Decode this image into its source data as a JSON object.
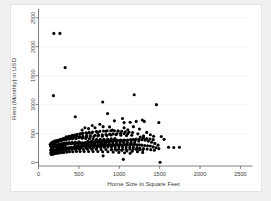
{
  "chart_data": {
    "type": "scatter",
    "title": "",
    "xlabel": "Home Size in Square Feet",
    "ylabel": "Rent (Monthly) in USD",
    "xlim": [
      0,
      2600
    ],
    "ylim": [
      -60,
      2600
    ],
    "xticks": [
      0,
      500,
      1000,
      1500,
      2000,
      2500
    ],
    "yticks": [
      0,
      500,
      1000,
      1500,
      2000,
      2500
    ],
    "xticklabels": [
      "0",
      "500",
      "1000",
      "1500",
      "2000",
      "2500"
    ],
    "yticklabels": [
      "0",
      "500",
      "1000",
      "1500",
      "2000",
      "2500"
    ],
    "grid": "horizontal",
    "legend": "none",
    "marker": "filled-circle",
    "marker_color": "#000000",
    "marker_size": 2.0,
    "points": [
      [
        190,
        2230
      ],
      [
        265,
        2230
      ],
      [
        330,
        1640
      ],
      [
        185,
        1155
      ],
      [
        795,
        1045
      ],
      [
        1185,
        1170
      ],
      [
        1460,
        1000
      ],
      [
        455,
        790
      ],
      [
        855,
        845
      ],
      [
        1490,
        690
      ],
      [
        1210,
        710
      ],
      [
        1285,
        735
      ],
      [
        1310,
        710
      ],
      [
        1060,
        690
      ],
      [
        1135,
        695
      ],
      [
        940,
        720
      ],
      [
        1040,
        760
      ],
      [
        665,
        640
      ],
      [
        700,
        600
      ],
      [
        760,
        660
      ],
      [
        800,
        620
      ],
      [
        880,
        615
      ],
      [
        620,
        585
      ],
      [
        575,
        600
      ],
      [
        540,
        560
      ],
      [
        1060,
        600
      ],
      [
        1105,
        565
      ],
      [
        1175,
        620
      ],
      [
        1250,
        580
      ],
      [
        985,
        545
      ],
      [
        915,
        560
      ],
      [
        835,
        540
      ],
      [
        730,
        520
      ],
      [
        660,
        510
      ],
      [
        600,
        505
      ],
      [
        525,
        495
      ],
      [
        470,
        480
      ],
      [
        420,
        470
      ],
      [
        380,
        455
      ],
      [
        345,
        445
      ],
      [
        1340,
        520
      ],
      [
        1385,
        480
      ],
      [
        1425,
        455
      ],
      [
        1300,
        460
      ],
      [
        1230,
        495
      ],
      [
        1155,
        470
      ],
      [
        1090,
        465
      ],
      [
        1020,
        470
      ],
      [
        960,
        480
      ],
      [
        900,
        475
      ],
      [
        845,
        465
      ],
      [
        790,
        455
      ],
      [
        735,
        460
      ],
      [
        685,
        450
      ],
      [
        640,
        445
      ],
      [
        595,
        440
      ],
      [
        550,
        435
      ],
      [
        505,
        430
      ],
      [
        465,
        425
      ],
      [
        430,
        420
      ],
      [
        395,
        415
      ],
      [
        360,
        410
      ],
      [
        325,
        405
      ],
      [
        295,
        400
      ],
      [
        265,
        395
      ],
      [
        235,
        385
      ],
      [
        205,
        375
      ],
      [
        180,
        360
      ],
      [
        160,
        340
      ],
      [
        145,
        315
      ],
      [
        1520,
        450
      ],
      [
        1555,
        400
      ],
      [
        1610,
        265
      ],
      [
        1675,
        260
      ],
      [
        1745,
        265
      ],
      [
        1480,
        300
      ],
      [
        1440,
        330
      ],
      [
        1400,
        350
      ],
      [
        1360,
        370
      ],
      [
        1320,
        385
      ],
      [
        1280,
        395
      ],
      [
        1245,
        400
      ],
      [
        1210,
        405
      ],
      [
        1175,
        400
      ],
      [
        1140,
        395
      ],
      [
        1105,
        390
      ],
      [
        1070,
        385
      ],
      [
        1035,
        380
      ],
      [
        1000,
        380
      ],
      [
        970,
        375
      ],
      [
        940,
        375
      ],
      [
        910,
        370
      ],
      [
        880,
        370
      ],
      [
        850,
        365
      ],
      [
        820,
        365
      ],
      [
        790,
        360
      ],
      [
        760,
        360
      ],
      [
        730,
        355
      ],
      [
        700,
        355
      ],
      [
        670,
        350
      ],
      [
        640,
        350
      ],
      [
        610,
        345
      ],
      [
        580,
        345
      ],
      [
        550,
        340
      ],
      [
        520,
        340
      ],
      [
        490,
        335
      ],
      [
        460,
        335
      ],
      [
        430,
        330
      ],
      [
        400,
        325
      ],
      [
        370,
        320
      ],
      [
        340,
        315
      ],
      [
        310,
        310
      ],
      [
        285,
        305
      ],
      [
        260,
        295
      ],
      [
        235,
        285
      ],
      [
        215,
        275
      ],
      [
        195,
        265
      ],
      [
        175,
        250
      ],
      [
        160,
        235
      ],
      [
        150,
        215
      ],
      [
        1490,
        240
      ],
      [
        1455,
        255
      ],
      [
        1420,
        270
      ],
      [
        1385,
        285
      ],
      [
        1350,
        290
      ],
      [
        1315,
        295
      ],
      [
        1280,
        300
      ],
      [
        1250,
        305
      ],
      [
        1220,
        305
      ],
      [
        1190,
        310
      ],
      [
        1160,
        310
      ],
      [
        1130,
        310
      ],
      [
        1100,
        310
      ],
      [
        1070,
        310
      ],
      [
        1040,
        305
      ],
      [
        1010,
        305
      ],
      [
        985,
        305
      ],
      [
        960,
        305
      ],
      [
        935,
        300
      ],
      [
        910,
        300
      ],
      [
        885,
        300
      ],
      [
        860,
        300
      ],
      [
        835,
        295
      ],
      [
        810,
        295
      ],
      [
        785,
        295
      ],
      [
        760,
        290
      ],
      [
        735,
        290
      ],
      [
        710,
        290
      ],
      [
        685,
        285
      ],
      [
        660,
        285
      ],
      [
        635,
        285
      ],
      [
        610,
        280
      ],
      [
        585,
        280
      ],
      [
        560,
        280
      ],
      [
        535,
        275
      ],
      [
        510,
        275
      ],
      [
        485,
        270
      ],
      [
        460,
        270
      ],
      [
        435,
        265
      ],
      [
        410,
        265
      ],
      [
        385,
        260
      ],
      [
        360,
        255
      ],
      [
        335,
        250
      ],
      [
        310,
        245
      ],
      [
        290,
        240
      ],
      [
        270,
        235
      ],
      [
        250,
        230
      ],
      [
        230,
        225
      ],
      [
        210,
        215
      ],
      [
        190,
        205
      ],
      [
        175,
        195
      ],
      [
        165,
        185
      ],
      [
        155,
        175
      ],
      [
        1050,
        55
      ],
      [
        800,
        115
      ],
      [
        1505,
        5
      ],
      [
        1290,
        175
      ],
      [
        1225,
        185
      ],
      [
        1160,
        195
      ],
      [
        1095,
        200
      ],
      [
        1030,
        210
      ],
      [
        965,
        215
      ],
      [
        900,
        220
      ],
      [
        835,
        225
      ],
      [
        775,
        225
      ],
      [
        715,
        230
      ],
      [
        660,
        230
      ],
      [
        605,
        230
      ],
      [
        555,
        230
      ],
      [
        505,
        230
      ],
      [
        460,
        225
      ],
      [
        415,
        225
      ],
      [
        375,
        220
      ],
      [
        340,
        215
      ],
      [
        305,
        210
      ],
      [
        275,
        205
      ],
      [
        245,
        200
      ],
      [
        220,
        190
      ],
      [
        200,
        180
      ],
      [
        180,
        170
      ],
      [
        165,
        160
      ],
      [
        155,
        150
      ],
      [
        1135,
        160
      ],
      [
        1065,
        170
      ],
      [
        995,
        175
      ],
      [
        925,
        180
      ],
      [
        860,
        185
      ],
      [
        795,
        185
      ],
      [
        735,
        190
      ],
      [
        675,
        190
      ],
      [
        620,
        190
      ],
      [
        565,
        190
      ],
      [
        515,
        190
      ],
      [
        470,
        190
      ],
      [
        425,
        185
      ],
      [
        385,
        185
      ],
      [
        350,
        180
      ],
      [
        315,
        175
      ],
      [
        285,
        170
      ],
      [
        255,
        165
      ],
      [
        230,
        160
      ],
      [
        210,
        155
      ],
      [
        190,
        150
      ],
      [
        175,
        145
      ],
      [
        160,
        140
      ],
      [
        540,
        420
      ],
      [
        585,
        415
      ],
      [
        630,
        410
      ],
      [
        675,
        405
      ],
      [
        720,
        400
      ],
      [
        765,
        400
      ],
      [
        810,
        400
      ],
      [
        855,
        405
      ],
      [
        900,
        410
      ],
      [
        945,
        415
      ],
      [
        465,
        415
      ],
      [
        420,
        410
      ],
      [
        380,
        405
      ],
      [
        345,
        400
      ],
      [
        315,
        395
      ],
      [
        290,
        385
      ],
      [
        265,
        375
      ],
      [
        245,
        365
      ],
      [
        225,
        355
      ],
      [
        205,
        345
      ],
      [
        190,
        335
      ],
      [
        178,
        325
      ],
      [
        168,
        310
      ],
      [
        158,
        295
      ],
      [
        150,
        280
      ],
      [
        610,
        365
      ],
      [
        655,
        365
      ],
      [
        700,
        370
      ],
      [
        745,
        370
      ],
      [
        790,
        375
      ],
      [
        835,
        375
      ],
      [
        880,
        380
      ],
      [
        925,
        385
      ],
      [
        970,
        390
      ],
      [
        1015,
        390
      ],
      [
        1060,
        390
      ],
      [
        1105,
        385
      ],
      [
        1150,
        380
      ],
      [
        1195,
        375
      ],
      [
        1240,
        370
      ],
      [
        500,
        360
      ],
      [
        455,
        355
      ],
      [
        415,
        350
      ],
      [
        378,
        345
      ],
      [
        345,
        340
      ],
      [
        318,
        335
      ],
      [
        292,
        328
      ],
      [
        268,
        320
      ],
      [
        246,
        312
      ],
      [
        226,
        302
      ],
      [
        208,
        292
      ],
      [
        192,
        280
      ],
      [
        180,
        268
      ],
      [
        170,
        255
      ],
      [
        162,
        242
      ],
      [
        560,
        320
      ],
      [
        605,
        322
      ],
      [
        650,
        325
      ],
      [
        695,
        328
      ],
      [
        740,
        330
      ],
      [
        785,
        332
      ],
      [
        830,
        335
      ],
      [
        875,
        338
      ],
      [
        920,
        340
      ],
      [
        965,
        342
      ],
      [
        1010,
        344
      ],
      [
        1055,
        345
      ],
      [
        1100,
        345
      ],
      [
        1145,
        344
      ],
      [
        1190,
        342
      ],
      [
        520,
        252
      ],
      [
        478,
        250
      ],
      [
        438,
        248
      ],
      [
        400,
        245
      ],
      [
        366,
        242
      ],
      [
        334,
        238
      ],
      [
        306,
        234
      ],
      [
        280,
        230
      ],
      [
        256,
        224
      ],
      [
        234,
        218
      ],
      [
        214,
        212
      ],
      [
        196,
        204
      ],
      [
        182,
        196
      ],
      [
        170,
        188
      ],
      [
        160,
        178
      ],
      [
        590,
        255
      ],
      [
        635,
        258
      ],
      [
        680,
        260
      ],
      [
        725,
        262
      ],
      [
        770,
        264
      ],
      [
        815,
        266
      ],
      [
        860,
        268
      ],
      [
        905,
        270
      ],
      [
        950,
        272
      ],
      [
        995,
        272
      ],
      [
        1040,
        272
      ],
      [
        1085,
        270
      ],
      [
        1130,
        268
      ],
      [
        1175,
        264
      ],
      [
        1220,
        260
      ],
      [
        700,
        470
      ],
      [
        745,
        475
      ],
      [
        790,
        480
      ],
      [
        835,
        485
      ],
      [
        880,
        490
      ],
      [
        925,
        495
      ],
      [
        970,
        498
      ],
      [
        1015,
        500
      ],
      [
        1060,
        500
      ],
      [
        1105,
        498
      ],
      [
        640,
        465
      ],
      [
        595,
        460
      ],
      [
        550,
        455
      ],
      [
        508,
        450
      ],
      [
        470,
        445
      ],
      [
        436,
        440
      ],
      [
        404,
        434
      ],
      [
        374,
        428
      ],
      [
        346,
        420
      ],
      [
        320,
        412
      ],
      [
        296,
        404
      ],
      [
        274,
        394
      ],
      [
        254,
        384
      ],
      [
        236,
        372
      ],
      [
        220,
        360
      ],
      [
        206,
        348
      ],
      [
        194,
        334
      ],
      [
        184,
        320
      ],
      [
        176,
        306
      ],
      [
        170,
        292
      ],
      [
        760,
        540
      ],
      [
        805,
        545
      ],
      [
        850,
        548
      ],
      [
        895,
        550
      ],
      [
        940,
        548
      ],
      [
        985,
        545
      ],
      [
        1030,
        540
      ],
      [
        1075,
        532
      ],
      [
        1120,
        525
      ],
      [
        1165,
        518
      ],
      [
        715,
        535
      ],
      [
        670,
        528
      ],
      [
        628,
        520
      ],
      [
        588,
        512
      ],
      [
        550,
        504
      ],
      [
        514,
        496
      ],
      [
        480,
        486
      ],
      [
        448,
        476
      ],
      [
        418,
        466
      ],
      [
        390,
        454
      ],
      [
        364,
        442
      ],
      [
        340,
        430
      ],
      [
        318,
        418
      ],
      [
        298,
        404
      ],
      [
        280,
        390
      ],
      [
        1260,
        440
      ],
      [
        1300,
        425
      ],
      [
        1340,
        415
      ],
      [
        1380,
        405
      ],
      [
        1420,
        395
      ],
      [
        1255,
        250
      ],
      [
        1300,
        240
      ],
      [
        1345,
        232
      ],
      [
        1390,
        222
      ],
      [
        1435,
        212
      ],
      [
        905,
        225
      ],
      [
        950,
        228
      ],
      [
        995,
        230
      ],
      [
        1040,
        230
      ],
      [
        1085,
        228
      ],
      [
        455,
        300
      ],
      [
        495,
        302
      ],
      [
        535,
        305
      ],
      [
        575,
        306
      ],
      [
        615,
        308
      ],
      [
        655,
        310
      ],
      [
        695,
        312
      ],
      [
        735,
        313
      ],
      [
        775,
        314
      ],
      [
        815,
        315
      ],
      [
        330,
        285
      ],
      [
        300,
        278
      ],
      [
        272,
        270
      ],
      [
        248,
        262
      ],
      [
        228,
        252
      ],
      [
        1130,
        232
      ],
      [
        1170,
        230
      ],
      [
        1210,
        228
      ],
      [
        1250,
        222
      ],
      [
        1290,
        215
      ]
    ]
  }
}
